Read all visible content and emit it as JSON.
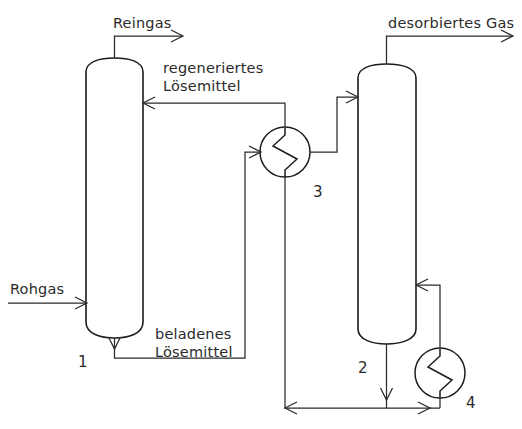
{
  "diagram": {
    "colors": {
      "background": "#ffffff",
      "line": "#2a2a2a",
      "vessel_outline": "#1c1c1c",
      "text": "#2b2b2b"
    },
    "equipment": [
      {
        "tag": "1",
        "kind": "column",
        "role": "absorber",
        "tag_x": 78,
        "tag_y": 356
      },
      {
        "tag": "2",
        "kind": "column",
        "role": "desorber",
        "tag_x": 358,
        "tag_y": 362
      },
      {
        "tag": "3",
        "kind": "heat-exchanger",
        "role": "solvent-solvent-exchanger",
        "tag_x": 313,
        "tag_y": 186
      },
      {
        "tag": "4",
        "kind": "heat-exchanger",
        "role": "reboiler",
        "tag_x": 466,
        "tag_y": 397
      }
    ],
    "stream_labels": [
      {
        "id": "reingas",
        "text": "Reingas",
        "x": 113,
        "y": 18
      },
      {
        "id": "regeneriertes-loesemittel-line1",
        "text": "regeneriertes",
        "x": 163,
        "y": 63
      },
      {
        "id": "regeneriertes-loesemittel-line2",
        "text": "Lösemittel",
        "x": 163,
        "y": 81
      },
      {
        "id": "desorbiertes-gas",
        "text": "desorbiertes Gas",
        "x": 388,
        "y": 18
      },
      {
        "id": "rohgas",
        "text": "Rohgas",
        "x": 10,
        "y": 284
      },
      {
        "id": "beladenes-loesemittel-line1",
        "text": "beladenes",
        "x": 155,
        "y": 329
      },
      {
        "id": "beladenes-loesemittel-line2",
        "text": "Lösemittel",
        "x": 155,
        "y": 347
      }
    ]
  }
}
